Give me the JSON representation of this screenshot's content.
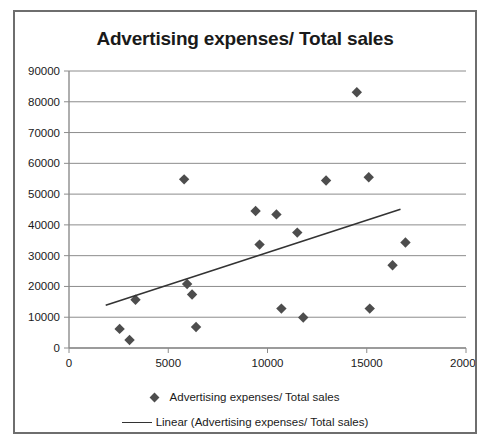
{
  "chart_data": {
    "type": "scatter",
    "title": "Advertising expenses/ Total sales",
    "xlabel": "",
    "ylabel": "",
    "xlim": [
      0,
      20000
    ],
    "ylim": [
      0,
      90000
    ],
    "xticks": [
      "0",
      "5000",
      "10000",
      "15000",
      "20000"
    ],
    "yticks": [
      "0",
      "10000",
      "20000",
      "30000",
      "40000",
      "50000",
      "60000",
      "70000",
      "80000",
      "90000"
    ],
    "grid": "horizontal",
    "legend_position": "bottom",
    "series": [
      {
        "name": "Advertising expenses/ Total sales",
        "marker": "diamond",
        "color": "#4d4d4d",
        "points": [
          {
            "x": 2550,
            "y": 6200
          },
          {
            "x": 3050,
            "y": 2600
          },
          {
            "x": 3350,
            "y": 15700
          },
          {
            "x": 5800,
            "y": 54800
          },
          {
            "x": 5950,
            "y": 20800
          },
          {
            "x": 6200,
            "y": 17400
          },
          {
            "x": 6400,
            "y": 6800
          },
          {
            "x": 9400,
            "y": 44500
          },
          {
            "x": 9600,
            "y": 33600
          },
          {
            "x": 10450,
            "y": 43400
          },
          {
            "x": 10700,
            "y": 12800
          },
          {
            "x": 11500,
            "y": 37500
          },
          {
            "x": 11800,
            "y": 9900
          },
          {
            "x": 12950,
            "y": 54400
          },
          {
            "x": 14500,
            "y": 83100
          },
          {
            "x": 15100,
            "y": 55500
          },
          {
            "x": 15150,
            "y": 12800
          },
          {
            "x": 16300,
            "y": 26900
          },
          {
            "x": 16950,
            "y": 34300
          }
        ]
      }
    ],
    "trendline": {
      "name": "Linear (Advertising expenses/ Total sales)",
      "color": "#333333",
      "x_start": 1850,
      "y_start": 13900,
      "x_end": 16700,
      "y_end": 45100
    }
  },
  "legend": {
    "series_label": "Advertising expenses/ Total sales",
    "trend_label": "Linear (Advertising expenses/ Total sales)",
    "series_marker": "diamond-marker-icon",
    "trend_marker": "line-marker-icon"
  }
}
